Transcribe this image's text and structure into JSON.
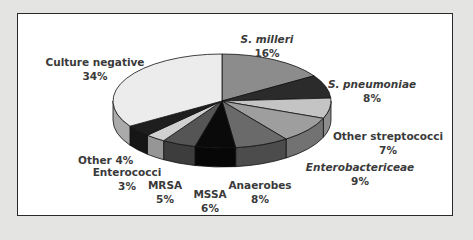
{
  "chart_data": {
    "type": "pie",
    "title": "",
    "style": "3d-exploded-none",
    "categories": [
      "S. milleri",
      "S. pneumoniae",
      "Other streptococci",
      "Enterobactericeae",
      "Anaerobes",
      "MSSA",
      "MRSA",
      "Enterococci",
      "Other",
      "Culture negative"
    ],
    "values": [
      16,
      8,
      7,
      9,
      8,
      6,
      5,
      3,
      4,
      34
    ],
    "unit": "%",
    "italic_labels": [
      "S. milleri",
      "S. pneumoniae",
      "Enterobactericeae"
    ],
    "colors": [
      "#8c8c8c",
      "#2b2b2b",
      "#c4c4c4",
      "#9e9e9e",
      "#6a6a6a",
      "#0a0a0a",
      "#555555",
      "#d0d0d0",
      "#1e1e1e",
      "#ececec"
    ]
  },
  "labels": [
    {
      "name": "S. milleri",
      "value": "16%",
      "italic": true
    },
    {
      "name": "S. pneumoniae",
      "value": "8%",
      "italic": true
    },
    {
      "name": "Other streptococci",
      "value": "7%",
      "italic": false
    },
    {
      "name": "Enterobactericeae",
      "value": "9%",
      "italic": true
    },
    {
      "name": "Anaerobes",
      "value": "8%",
      "italic": false
    },
    {
      "name": "MSSA",
      "value": "6%",
      "italic": false
    },
    {
      "name": "MRSA",
      "value": "5%",
      "italic": false
    },
    {
      "name": "Enterococci",
      "value": "3%",
      "italic": false
    },
    {
      "name": "Other 4%",
      "value": "",
      "italic": false
    },
    {
      "name": "Culture negative",
      "value": "34%",
      "italic": false
    }
  ]
}
